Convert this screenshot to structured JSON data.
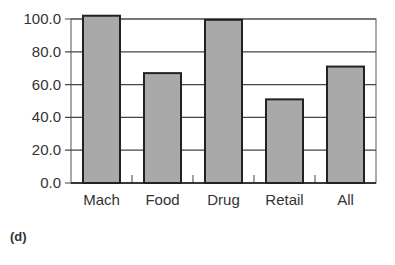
{
  "panel_label": "(d)",
  "colors": {
    "bar_fill": "#a9a9a9",
    "bar_stroke": "#222222",
    "grid": "#444444",
    "text": "#333333"
  },
  "chart_data": {
    "type": "bar",
    "title": "",
    "xlabel": "",
    "ylabel": "",
    "categories": [
      "Mach",
      "Food",
      "Drug",
      "Retail",
      "All"
    ],
    "values": [
      102,
      67,
      99.5,
      51,
      71
    ],
    "ylim": [
      0,
      100
    ],
    "yticks": [
      "0.0",
      "20.0",
      "40.0",
      "60.0",
      "80.0",
      "100.0"
    ],
    "grid": true,
    "legend": null
  }
}
